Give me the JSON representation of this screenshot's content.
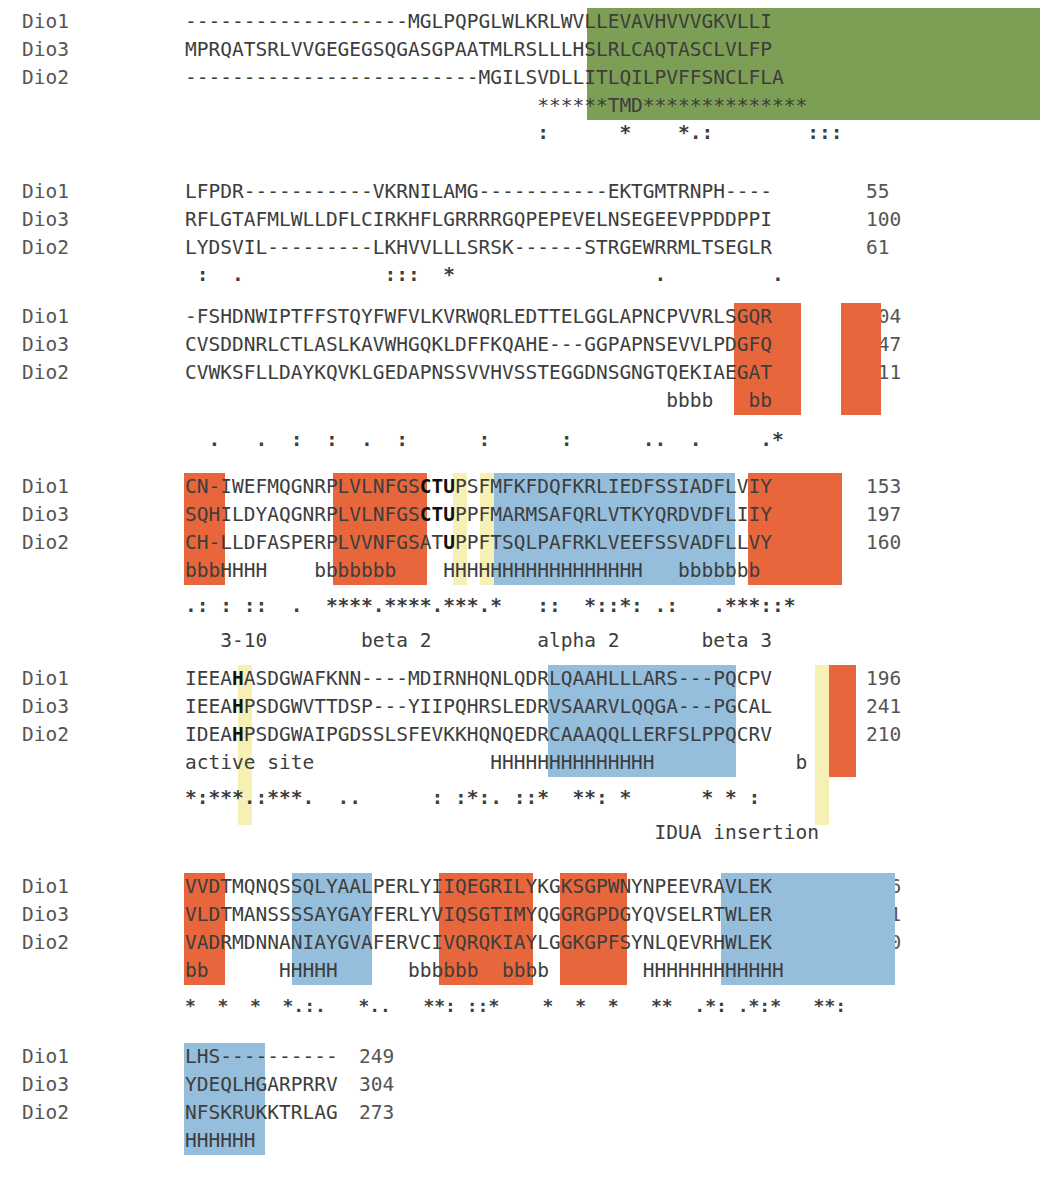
{
  "figure": {
    "type": "multiple-sequence-alignment",
    "sequence_names": [
      "Dio1",
      "Dio3",
      "Dio2"
    ],
    "colors": {
      "tmd_green": "#7d9e55",
      "beta_strand_orange": "#e8663c",
      "alpha_helix_blue": "#94bedc",
      "catalytic_yellow": "#f7f0b4",
      "text": "#3d3d3d"
    },
    "legend_meaning": {
      "green": "TMD transmembrane domain",
      "orange": "beta strand (b)",
      "blue": "alpha helix (H)",
      "yellow": "catalytic / active site residues"
    }
  },
  "blocks": [
    {
      "id": "block1",
      "rows": [
        {
          "label": "Dio1",
          "seq": "-------------------MGLPQPGLWLKRLWVLLEVAVHVVVGKVLLI",
          "num": "31"
        },
        {
          "label": "Dio3",
          "seq": "MPRQATSRLVVGEGEGSQGASGPAATMLRSLLLHSLRLCAQTASCLVLFP",
          "num": "50"
        },
        {
          "label": "Dio2",
          "seq": "-------------------------MGILSVDLLITLQILPVFFSNCLFLA",
          "num": "26"
        }
      ],
      "struct": "                              ******TMD**************",
      "conservation": "                              :      *    *.:        :::"
    },
    {
      "id": "block2",
      "rows": [
        {
          "label": "Dio1",
          "seq": "LFPDR-----------VKRNILAMG-----------EKTGMTRNPH----",
          "num": "55"
        },
        {
          "label": "Dio3",
          "seq": "RFLGTAFMLWLLDFLCIRKHFLGRRRRGQPEPEVELNSEGEEVPPDDPPI",
          "num": "100"
        },
        {
          "label": "Dio2",
          "seq": "LYDSVIL---------LKHVVLLLSRSK------STRGEWRRMLTSEGLR",
          "num": "61"
        }
      ],
      "struct": "",
      "conservation": " :  .            :::  *                 .         ."
    },
    {
      "id": "block3",
      "rows": [
        {
          "label": "Dio1",
          "seq": "-FSHDNWIPTFFSTQYFWFVLKVRWQRLEDTTELGGLAPNCPVVRLSGQR",
          "num": "104"
        },
        {
          "label": "Dio3",
          "seq": "CVSDDNRLCTLASLKAVWHGQKLDFFKQAHE---GGPAPNSEVVLPDGFQ",
          "num": "147"
        },
        {
          "label": "Dio2",
          "seq": "CVWKSFLLDAYKQVKLGEDAPNSSVVHVSSTEGGDNSGNGTQEKIAEGAT",
          "num": "111"
        }
      ],
      "struct": "                                         bbbb   bb ",
      "conservation": "  .   .  :  :  .  :      :      :      ..  .     .*"
    },
    {
      "id": "block4",
      "rows": [
        {
          "label": "Dio1",
          "seq": "CN-IWEFMQGNRPLVLNFGSCTUPSFMFKFDQFKRLIEDFSSIADFLVIY",
          "num": "153"
        },
        {
          "label": "Dio3",
          "seq": "SQHILDYAQGNRPLVLNFGSCTUPPFMARMSAFQRLVTKYQRDVDFLIIY",
          "num": "197"
        },
        {
          "label": "Dio2",
          "seq": "CH-LLDFASPERPLVVNFGSATUPPFTSQLPAFRKLVEEFSSVADFLLVY",
          "num": "160"
        }
      ],
      "struct": "bbbHHHH    bbbbbbb    HHHHHHHHHHHHHHHHH   bbbbbbb",
      "conservation": ".: : ::  .  ****.****.***.*   ::  *::*: .:   .***::*",
      "ss_labels": "   3-10        beta 2         alpha 2       beta 3"
    },
    {
      "id": "block5",
      "rows": [
        {
          "label": "Dio1",
          "seq": "IEEAHASDGWAFKNN----MDIRNHQNLQDRLQAAHLLLARS---PQCPV",
          "num": "196"
        },
        {
          "label": "Dio3",
          "seq": "IEEAHPSDGWVTTDSP---YIIPQHRSLEDRVSAARVLQQGA---PGCAL",
          "num": "241"
        },
        {
          "label": "Dio2",
          "seq": "IDEAHPSDGWAIPGDSSLSFEVKKHQNQEDRCAAAQQLLERFSLPPQCRV",
          "num": "210"
        }
      ],
      "struct": "active site               HHHHHHHHHHHHHH            b",
      "conservation": "*:***.:***.  ..      : :*:. ::*  **: *      * * :",
      "ss_labels": "                                        IDUA insertion"
    },
    {
      "id": "block6",
      "rows": [
        {
          "label": "Dio1",
          "seq": "VVDTMQNQSSQLYAALPERLYIIQEGRILYKGKSGPWNYNPEEVRAVLEK",
          "num": "246"
        },
        {
          "label": "Dio3",
          "seq": "VLDTMANSSSSAYGAYFERLYVIQSGTIMYQGGRGPDGYQVSELRTWLER",
          "num": "291"
        },
        {
          "label": "Dio2",
          "seq": "VADRMDNNANIAYGVAFERVCIVQRQKIAYLGGKGPFSYNLQEVRHWLEK",
          "num": "260"
        }
      ],
      "struct": "bb      HHHHH      bbbbbb  bbbb        HHHHHHHHHHHH",
      "conservation": "*  *  *  *.:.   *..   **: ::*    *  *  *   **  .*: .*:*   **:"
    },
    {
      "id": "block7",
      "rows": [
        {
          "label": "Dio1",
          "seq": "LHS----------",
          "num": "249"
        },
        {
          "label": "Dio3",
          "seq": "YDEQLHGARPRRV",
          "num": "304"
        },
        {
          "label": "Dio2",
          "seq": "NFSKRUKKTRLAG",
          "num": "273"
        }
      ],
      "struct": "HHHHHH",
      "conservation": ""
    }
  ]
}
